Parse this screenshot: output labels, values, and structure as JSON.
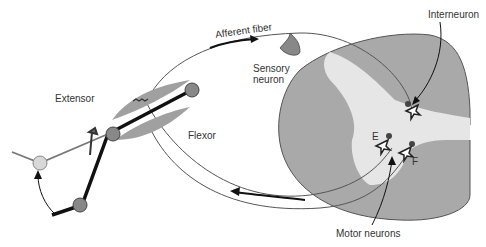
{
  "diagram": {
    "type": "reflex arc (flexor/extensor withdrawal)",
    "labels": {
      "afferent_fiber": "Afferent fiber",
      "sensory_neuron_line1": "Sensory",
      "sensory_neuron_line2": "neuron",
      "interneuron": "Interneuron",
      "extensor": "Extensor",
      "flexor": "Flexor",
      "motor_neuron_e": "E",
      "motor_neuron_f": "F",
      "motor_neurons": "Motor neurons"
    },
    "colors": {
      "gray_matter": "#a9a9a9",
      "white_matter": "#e6e6e6",
      "muscle": "#a0a0a0",
      "bone": "#111111",
      "joint": "#888888",
      "distal_joint": "#d8d8d8",
      "nerve": "#555555"
    }
  }
}
